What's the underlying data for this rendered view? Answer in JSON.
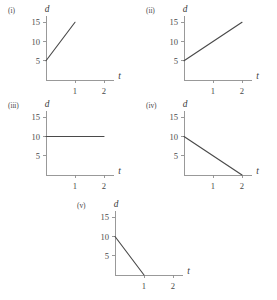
{
  "figure": {
    "background_color": "#ffffff",
    "axis_color": "#8e8e8e",
    "line_color": "#4a4a4a",
    "panel_order": [
      "i",
      "ii",
      "iii",
      "iv",
      "v"
    ]
  },
  "chart_data": [
    {
      "type": "line",
      "tag": "(i)",
      "title": "",
      "xlabel": "t",
      "ylabel": "d",
      "xlim": [
        0,
        2.35
      ],
      "ylim": [
        0,
        16.5
      ],
      "xticks": [
        1,
        2
      ],
      "xticklabels": [
        "1",
        "2"
      ],
      "yticks": [
        5,
        10,
        15
      ],
      "yticklabels": [
        "5",
        "10",
        "15"
      ],
      "grid": false,
      "legend": "none",
      "x": [
        0,
        1
      ],
      "values": [
        5,
        15
      ]
    },
    {
      "type": "line",
      "tag": "(ii)",
      "title": "",
      "xlabel": "t",
      "ylabel": "d",
      "xlim": [
        0,
        2.35
      ],
      "ylim": [
        0,
        16.5
      ],
      "xticks": [
        1,
        2
      ],
      "xticklabels": [
        "1",
        "2"
      ],
      "yticks": [
        5,
        10,
        15
      ],
      "yticklabels": [
        "5",
        "10",
        "15"
      ],
      "grid": false,
      "legend": "none",
      "x": [
        0,
        2
      ],
      "values": [
        5,
        15
      ]
    },
    {
      "type": "line",
      "tag": "(iii)",
      "title": "",
      "xlabel": "t",
      "ylabel": "d",
      "xlim": [
        0,
        2.35
      ],
      "ylim": [
        0,
        16.5
      ],
      "xticks": [
        1,
        2
      ],
      "xticklabels": [
        "1",
        "2"
      ],
      "yticks": [
        5,
        10,
        15
      ],
      "yticklabels": [
        "5",
        "10",
        "15"
      ],
      "grid": false,
      "legend": "none",
      "x": [
        0,
        2
      ],
      "values": [
        10,
        10
      ]
    },
    {
      "type": "line",
      "tag": "(iv)",
      "title": "",
      "xlabel": "t",
      "ylabel": "d",
      "xlim": [
        0,
        2.35
      ],
      "ylim": [
        0,
        16.5
      ],
      "xticks": [
        1,
        2
      ],
      "xticklabels": [
        "1",
        "2"
      ],
      "yticks": [
        5,
        10,
        15
      ],
      "yticklabels": [
        "5",
        "10",
        "15"
      ],
      "grid": false,
      "legend": "none",
      "x": [
        0,
        2
      ],
      "values": [
        10,
        0
      ]
    },
    {
      "type": "line",
      "tag": "(v)",
      "title": "",
      "xlabel": "t",
      "ylabel": "d",
      "xlim": [
        0,
        2.35
      ],
      "ylim": [
        0,
        16.5
      ],
      "xticks": [
        1,
        2
      ],
      "xticklabels": [
        "1",
        "2"
      ],
      "yticks": [
        5,
        10,
        15
      ],
      "yticklabels": [
        "5",
        "10",
        "15"
      ],
      "grid": false,
      "legend": "none",
      "x": [
        0,
        1
      ],
      "values": [
        10,
        0
      ]
    }
  ]
}
